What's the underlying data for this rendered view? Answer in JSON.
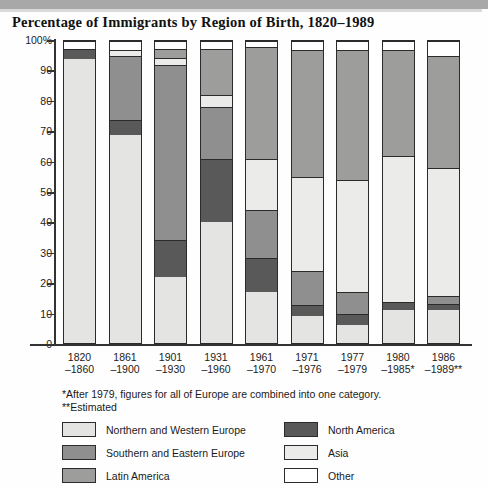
{
  "title": "Percentage of Immigrants by Region of Birth, 1820–1989",
  "notes": {
    "line1": "*After 1979, figures for all of Europe are combined into one category.",
    "line2": "**Estimated"
  },
  "legend": {
    "column1": [
      {
        "label": "Northern and Western Europe",
        "color": "#e4e4e2",
        "key": "nw_europe"
      },
      {
        "label": "Southern and Eastern Europe",
        "color": "#8f8f8f",
        "key": "se_europe"
      },
      {
        "label": "Latin America",
        "color": "#9d9d9b",
        "key": "latin_america"
      }
    ],
    "column2": [
      {
        "label": "North America",
        "color": "#595959",
        "key": "north_america"
      },
      {
        "label": "Asia",
        "color": "#ebebe9",
        "key": "asia"
      },
      {
        "label": "Other",
        "color": "#ffffff",
        "key": "other"
      }
    ]
  },
  "axis": {
    "y_ticks": [
      "100%",
      "90",
      "80",
      "70",
      "60",
      "50",
      "40",
      "30",
      "20",
      "10",
      "0"
    ],
    "y_values": [
      100,
      90,
      80,
      70,
      60,
      50,
      40,
      30,
      20,
      10,
      0
    ],
    "y_max": 100,
    "y_min": 0
  },
  "chart_data": {
    "type": "bar",
    "title": "Percentage of Immigrants by Region of Birth, 1820–1989",
    "xlabel": "",
    "ylabel": "",
    "ylim": [
      0,
      100
    ],
    "grid": false,
    "stacked": true,
    "legend_position": "bottom",
    "categories": [
      "1820–1860",
      "1861–1900",
      "1901–1930",
      "1931–1960",
      "1961–1970",
      "1971–1976",
      "1977–1979",
      "1980–1985*",
      "1986–1989**"
    ],
    "category_lines": [
      [
        "1820",
        "–1860"
      ],
      [
        "1861",
        "–1900"
      ],
      [
        "1901",
        "–1930"
      ],
      [
        "1931",
        "–1960"
      ],
      [
        "1961",
        "–1970"
      ],
      [
        "1971",
        "–1976"
      ],
      [
        "1977",
        "–1979"
      ],
      [
        "1980",
        "–1985*"
      ],
      [
        "1986",
        "–1989**"
      ]
    ],
    "series": [
      {
        "name": "Northern and Western Europe",
        "key": "nw_europe",
        "color": "#e4e4e2",
        "values": [
          94,
          69,
          22,
          40,
          17,
          9,
          6,
          11,
          11
        ]
      },
      {
        "name": "North America",
        "key": "north_america",
        "color": "#595959",
        "values": [
          3.5,
          5,
          12,
          21,
          11,
          3.5,
          3.5,
          2.5,
          2
        ]
      },
      {
        "name": "Southern and Eastern Europe",
        "key": "se_europe",
        "color": "#8f8f8f",
        "values": [
          0,
          21,
          58,
          17,
          16,
          11.5,
          7.5,
          0,
          2.5
        ]
      },
      {
        "name": "Asia",
        "key": "asia",
        "color": "#ebebe9",
        "values": [
          0,
          2,
          2.5,
          4,
          17,
          31,
          37,
          48.5,
          42.5
        ]
      },
      {
        "name": "Latin America",
        "key": "latin_america",
        "color": "#9d9d9b",
        "values": [
          0,
          0,
          3,
          15.5,
          37,
          42,
          43,
          35,
          37
        ]
      },
      {
        "name": "Other",
        "key": "other",
        "color": "#ffffff",
        "values": [
          2.5,
          3,
          2.5,
          2.5,
          2,
          3,
          3,
          3,
          5
        ]
      }
    ]
  }
}
